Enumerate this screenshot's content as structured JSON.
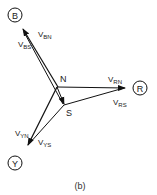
{
  "diagram": {
    "type": "phasor-diagram",
    "caption": "(b)",
    "terminals": {
      "B": {
        "label": "B"
      },
      "R": {
        "label": "R"
      },
      "Y": {
        "label": "Y"
      }
    },
    "points": {
      "N": {
        "label": "N"
      },
      "S": {
        "label": "S"
      }
    },
    "phasors": [
      {
        "id": "VBN",
        "main": "V",
        "sub": "BN",
        "from": "N",
        "to": "B"
      },
      {
        "id": "VBS",
        "main": "V",
        "sub": "BS",
        "from": "S",
        "to": "B"
      },
      {
        "id": "VRN",
        "main": "V",
        "sub": "RN",
        "from": "N",
        "to": "R"
      },
      {
        "id": "VRS",
        "main": "V",
        "sub": "RS",
        "from": "S",
        "to": "R"
      },
      {
        "id": "VYN",
        "main": "V",
        "sub": "YN",
        "from": "N",
        "to": "Y"
      },
      {
        "id": "VYS",
        "main": "V",
        "sub": "YS",
        "from": "S",
        "to": "Y"
      },
      {
        "id": "VNS",
        "main": "",
        "sub": "",
        "from": "N",
        "to": "S"
      }
    ]
  }
}
